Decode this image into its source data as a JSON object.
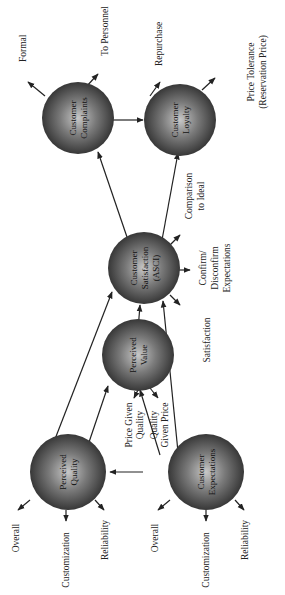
{
  "diagram": {
    "orientation": "rotated-90-ccw",
    "nodes": {
      "complaints": {
        "line1": "Customer",
        "line2": "Complaints"
      },
      "loyalty": {
        "line1": "Customer",
        "line2": "Loyalty"
      },
      "satisfaction": {
        "line1": "Customer",
        "line2": "Satisfaction",
        "line3": "(ASCI)"
      },
      "value": {
        "line1": "Perceived",
        "line2": "Value"
      },
      "quality": {
        "line1": "Perceived",
        "line2": "Quality"
      },
      "expectations": {
        "line1": "Customer",
        "line2": "Expectations"
      }
    },
    "labels": {
      "formal": "Formal",
      "to_personnel": "To Personnel",
      "repurchase": "Repurchase",
      "price_tolerance_1": "Price Tolerance",
      "price_tolerance_2": "(Reservation Price)",
      "comparison_1": "Comparison",
      "comparison_2": "to Ideal",
      "confirm_1": "Confirm/",
      "confirm_2": "Disconfirm",
      "confirm_3": "Expectations",
      "satisfaction": "Satisfaction",
      "price_given_1": "Price Given",
      "price_given_2": "Quality",
      "quality_given_1": "Quality",
      "quality_given_2": "Given Price",
      "q_overall": "Overall",
      "q_customization": "Customization",
      "q_reliability": "Reliability",
      "e_overall": "Overall",
      "e_customization": "Customization",
      "e_reliability": "Reliability"
    },
    "edges": [
      [
        "Customer Expectations",
        "Perceived Quality"
      ],
      [
        "Customer Expectations",
        "Perceived Value"
      ],
      [
        "Customer Expectations",
        "Customer Satisfaction (ASCI)"
      ],
      [
        "Perceived Quality",
        "Perceived Value"
      ],
      [
        "Perceived Quality",
        "Customer Satisfaction (ASCI)"
      ],
      [
        "Perceived Value",
        "Customer Satisfaction (ASCI)"
      ],
      [
        "Customer Satisfaction (ASCI)",
        "Customer Complaints"
      ],
      [
        "Customer Satisfaction (ASCI)",
        "Customer Loyalty"
      ],
      [
        "Customer Complaints",
        "Customer Loyalty"
      ]
    ]
  }
}
